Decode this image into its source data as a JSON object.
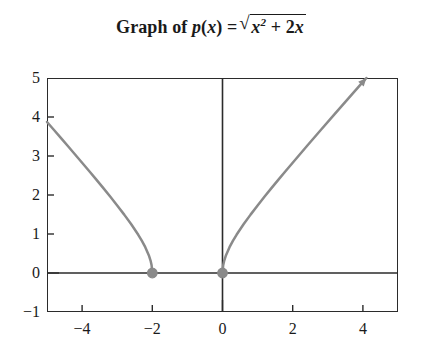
{
  "chart_data": {
    "type": "line",
    "title_parts": {
      "prefix": "Graph of ",
      "func_name": "p",
      "func_arg_open": "(",
      "func_var": "x",
      "func_arg_close": ")",
      "equals": "=",
      "radical_sign": "√",
      "radicand_base": "x",
      "radicand_exponent": "2",
      "radicand_tail": " + 2",
      "radicand_tail_var": "x"
    },
    "xlabel": "",
    "ylabel": "",
    "xlim": [
      -5,
      5
    ],
    "ylim": [
      -1,
      5
    ],
    "grid": false,
    "legend": "none",
    "x_ticks": [
      -4,
      -2,
      0,
      2,
      4
    ],
    "x_tick_labels": [
      "−4",
      "−2",
      "0",
      "2",
      "4"
    ],
    "y_ticks": [
      -1,
      0,
      1,
      2,
      3,
      4,
      5
    ],
    "y_tick_labels": [
      "−1",
      "0",
      "1",
      "2",
      "3",
      "4",
      "5"
    ],
    "series": [
      {
        "name": "p(x) = sqrt(x^2 + 2x)",
        "color": "#8a8a8a",
        "linewidth": 2.5,
        "branches": [
          {
            "name": "left-branch",
            "domain": [
              -5,
              -2
            ],
            "points": [
              [
                -5.0,
                3.873
              ],
              [
                -4.8,
                3.666
              ],
              [
                -4.6,
                3.458
              ],
              [
                -4.4,
                3.25
              ],
              [
                -4.2,
                3.04
              ],
              [
                -4.0,
                2.828
              ],
              [
                -3.8,
                2.615
              ],
              [
                -3.6,
                2.4
              ],
              [
                -3.4,
                2.182
              ],
              [
                -3.2,
                1.96
              ],
              [
                -3.0,
                1.732
              ],
              [
                -2.8,
                1.497
              ],
              [
                -2.6,
                1.249
              ],
              [
                -2.4,
                0.98
              ],
              [
                -2.3,
                0.831
              ],
              [
                -2.2,
                0.663
              ],
              [
                -2.1,
                0.458
              ],
              [
                -2.05,
                0.32
              ],
              [
                -2.02,
                0.199
              ],
              [
                -2.0,
                0.0
              ]
            ]
          },
          {
            "name": "right-branch",
            "domain": [
              0,
              4.099
            ],
            "points": [
              [
                0.0,
                0.0
              ],
              [
                0.02,
                0.201
              ],
              [
                0.05,
                0.32
              ],
              [
                0.1,
                0.458
              ],
              [
                0.2,
                0.663
              ],
              [
                0.3,
                0.831
              ],
              [
                0.4,
                0.98
              ],
              [
                0.6,
                1.249
              ],
              [
                0.8,
                1.497
              ],
              [
                1.0,
                1.732
              ],
              [
                1.2,
                1.96
              ],
              [
                1.4,
                2.182
              ],
              [
                1.6,
                2.4
              ],
              [
                1.8,
                2.615
              ],
              [
                2.0,
                2.828
              ],
              [
                2.4,
                3.25
              ],
              [
                2.8,
                3.666
              ],
              [
                3.2,
                4.079
              ],
              [
                3.6,
                4.49
              ],
              [
                4.0,
                4.899
              ],
              [
                4.099,
                5.0
              ]
            ]
          }
        ],
        "arrow_at_end": true
      }
    ],
    "markers": [
      {
        "name": "root-left",
        "x": -2,
        "y": 0,
        "color": "#8a8a8a",
        "radius": 4.8,
        "filled": true
      },
      {
        "name": "root-right",
        "x": 0,
        "y": 0,
        "color": "#8a8a8a",
        "radius": 4.8,
        "filled": true
      }
    ],
    "axis_lines": [
      {
        "name": "x-axis",
        "orientation": "horizontal",
        "value": 0,
        "color": "#2b2b2b"
      },
      {
        "name": "y-axis",
        "orientation": "vertical",
        "value": 0,
        "color": "#2b2b2b"
      }
    ],
    "annotations": []
  }
}
